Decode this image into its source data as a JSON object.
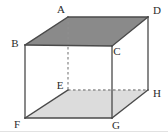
{
  "figure": {
    "name": "rectangular-cuboid-diagram",
    "canvas": {
      "width": 168,
      "height": 136
    },
    "colors": {
      "top_face_fill": "#8a8a8a",
      "bottom_face_fill": "#dcdcdc",
      "solid_edge": "#4a4a4a",
      "hidden_edge": "#8f8f8f",
      "label_text": "#2b2b2b",
      "background": "#ffffff",
      "baseline_rule": "#e2e2e2"
    },
    "vertices": [
      {
        "id": "A",
        "label": "A",
        "x": 68,
        "y": 17,
        "label_x": 61,
        "label_y": 9,
        "hidden": false
      },
      {
        "id": "B",
        "label": "B",
        "x": 25,
        "y": 45,
        "label_x": 15,
        "label_y": 43,
        "hidden": false
      },
      {
        "id": "C",
        "label": "C",
        "x": 112,
        "y": 46,
        "label_x": 117,
        "label_y": 51,
        "hidden": false
      },
      {
        "id": "D",
        "label": "D",
        "x": 148,
        "y": 17,
        "label_x": 157,
        "label_y": 10,
        "hidden": false
      },
      {
        "id": "E",
        "label": "E",
        "x": 68,
        "y": 90,
        "label_x": 60,
        "label_y": 85,
        "hidden": true
      },
      {
        "id": "F",
        "label": "F",
        "x": 25,
        "y": 118,
        "label_x": 17,
        "label_y": 124,
        "hidden": false
      },
      {
        "id": "G",
        "label": "G",
        "x": 112,
        "y": 118,
        "label_x": 116,
        "label_y": 125,
        "hidden": false
      },
      {
        "id": "H",
        "label": "H",
        "x": 148,
        "y": 90,
        "label_x": 157,
        "label_y": 93,
        "hidden": false
      }
    ],
    "faces": [
      {
        "id": "top",
        "name": "top-face",
        "path": "M 68 17 L 148 17 L 112 46 L 25 45 Z",
        "fill": "#8a8a8a"
      },
      {
        "id": "bottom",
        "name": "bottom-face",
        "path": "M 68 90 L 148 90 L 112 118 L 25 118 Z",
        "fill": "#dcdcdc"
      }
    ],
    "solid_edges": [
      {
        "id": "AB",
        "name": "edge-a-b",
        "x1": 68,
        "y1": 17,
        "x2": 25,
        "y2": 45
      },
      {
        "id": "AD",
        "name": "edge-a-d",
        "x1": 68,
        "y1": 17,
        "x2": 148,
        "y2": 17
      },
      {
        "id": "DC",
        "name": "edge-d-c",
        "x1": 148,
        "y1": 17,
        "x2": 112,
        "y2": 46
      },
      {
        "id": "BC",
        "name": "edge-b-c",
        "x1": 25,
        "y1": 45,
        "x2": 112,
        "y2": 46
      },
      {
        "id": "BF",
        "name": "edge-b-f",
        "x1": 25,
        "y1": 45,
        "x2": 25,
        "y2": 118
      },
      {
        "id": "CG",
        "name": "edge-c-g",
        "x1": 112,
        "y1": 46,
        "x2": 112,
        "y2": 118
      },
      {
        "id": "DH",
        "name": "edge-d-h",
        "x1": 148,
        "y1": 17,
        "x2": 148,
        "y2": 90
      },
      {
        "id": "FG",
        "name": "edge-f-g",
        "x1": 25,
        "y1": 118,
        "x2": 112,
        "y2": 118
      },
      {
        "id": "GH",
        "name": "edge-g-h",
        "x1": 112,
        "y1": 118,
        "x2": 148,
        "y2": 90
      },
      {
        "id": "FE",
        "name": "edge-f-e",
        "x1": 25,
        "y1": 118,
        "x2": 68,
        "y2": 90
      }
    ],
    "hidden_edges": [
      {
        "id": "AE",
        "name": "hidden-edge-a-e",
        "x1": 68,
        "y1": 17,
        "x2": 68,
        "y2": 90
      },
      {
        "id": "EH",
        "name": "hidden-edge-e-h",
        "x1": 68,
        "y1": 90,
        "x2": 148,
        "y2": 90
      }
    ]
  }
}
